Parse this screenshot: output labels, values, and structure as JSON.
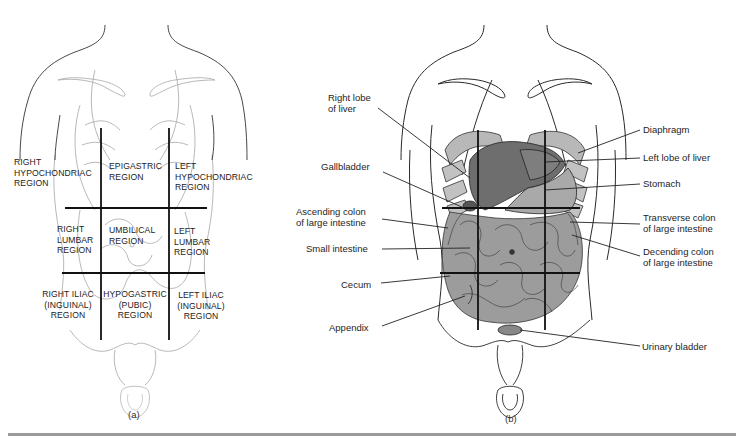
{
  "figure_a": {
    "caption": "(a)",
    "regions": {
      "right_hypochondriac": "RIGHT\nHYPOCHONDRIAC\nREGION",
      "epigastric": "EPIGASTRIC\nREGION",
      "left_hypochondriac": "LEFT\nHYPOCHONDRIAC\nREGION",
      "right_lumbar": "RIGHT\nLUMBAR\nREGION",
      "umbilical": "UMBILICAL\nREGION",
      "left_lumbar": "LEFT\nLUMBAR\nREGION",
      "right_iliac": "RIGHT ILIAC\n(INGUINAL)\nREGION",
      "hypogastric": "HYPOGASTRIC\n(PUBIC)\nREGION",
      "left_iliac": "LEFT ILIAC\n(INGUINAL)\nREGION"
    }
  },
  "figure_b": {
    "caption": "(b)",
    "labels_left": {
      "right_lobe_liver": "Right lobe\nof liver",
      "gallbladder": "Gallbladder",
      "ascending_colon": "Ascending colon\nof large intestine",
      "small_intestine": "Small intestine",
      "cecum": "Cecum",
      "appendix": "Appendix"
    },
    "labels_right": {
      "diaphragm": "Diaphragm",
      "left_lobe_liver": "Left lobe of liver",
      "stomach": "Stomach",
      "transverse_colon": "Transverse colon\nof large intestine",
      "descending_colon": "Decending colon\nof large intestine",
      "urinary_bladder": "Urinary bladder"
    }
  },
  "colors": {
    "organ_fill": "#9c9c9c",
    "liver_dark": "#6e6e6e",
    "grid_line": "#111111",
    "outline": "#2a2a2a",
    "faint_outline": "#b8b8b8"
  }
}
